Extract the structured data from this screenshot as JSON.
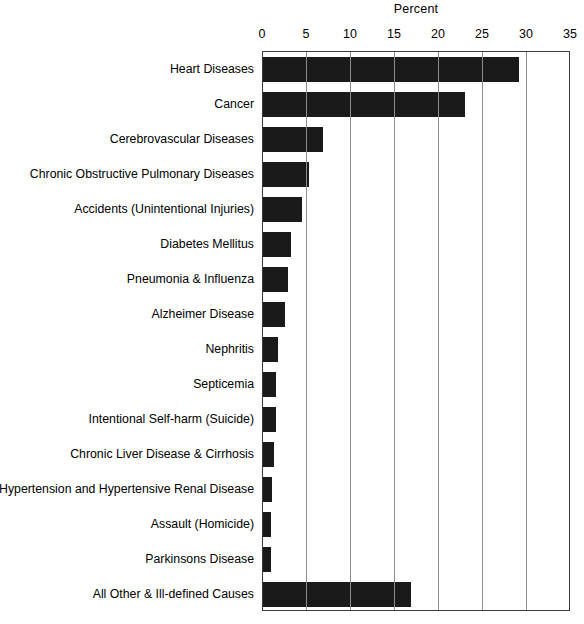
{
  "chart_data": {
    "type": "bar",
    "orientation": "horizontal",
    "title": "",
    "xlabel": "Percent",
    "ylabel": "",
    "xlim": [
      0,
      35
    ],
    "xticks": [
      0,
      5,
      10,
      15,
      20,
      25,
      30,
      35
    ],
    "xtick_labels": [
      "0",
      "5",
      "10",
      "15",
      "20",
      "25",
      "30",
      "35"
    ],
    "grid": true,
    "grid_axis": "x",
    "legend": false,
    "bar_color": "#1a1a1a",
    "categories": [
      "Heart Diseases",
      "Cancer",
      "Cerebrovascular Diseases",
      "Chronic Obstructive Pulmonary Diseases",
      "Accidents (Unintentional Injuries)",
      "Diabetes Mellitus",
      "Pneumonia & Influenza",
      "Alzheimer Disease",
      "Nephritis",
      "Septicemia",
      "Intentional Self-harm (Suicide)",
      "Chronic Liver Disease & Cirrhosis",
      "Hypertension and Hypertensive Renal Disease",
      "Assault (Homicide)",
      "Parkinsons Disease",
      "All Other & Ill-defined Causes"
    ],
    "values": [
      29.1,
      23.0,
      6.8,
      5.2,
      4.4,
      3.2,
      2.8,
      2.5,
      1.7,
      1.5,
      1.5,
      1.2,
      1.0,
      0.9,
      0.9,
      16.8
    ]
  }
}
